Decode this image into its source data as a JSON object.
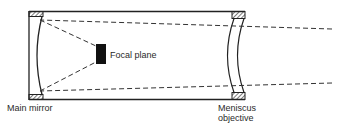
{
  "diagram": {
    "type": "optical-schematic",
    "labels": {
      "focal_plane": "Focal plane",
      "main_mirror": "Main mirror",
      "meniscus_line1": "Meniscus",
      "meniscus_line2": "objective"
    },
    "components": [
      {
        "name": "Main mirror",
        "position": "left end of tube",
        "shape": "concave spherical mirror"
      },
      {
        "name": "Focal plane",
        "position": "inside tube, center",
        "shape": "black rectangle"
      },
      {
        "name": "Meniscus objective",
        "position": "right end of tube",
        "shape": "curved meniscus lens"
      }
    ],
    "rays": "dashed lines enter from right, pass through meniscus, reflect off main mirror, converge at focal plane",
    "colors": {
      "stroke": "#222222",
      "fill_focal": "#111111",
      "background": "#ffffff"
    }
  }
}
